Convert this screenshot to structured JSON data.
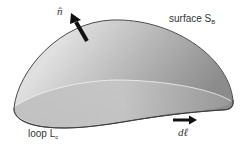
{
  "diagram": {
    "type": "surface bounded by a closed loop",
    "labels": {
      "normal": "n̂",
      "surface": "surface S",
      "surface_sub": "B",
      "loop": "loop L",
      "loop_sub": "c",
      "line_element": "dℓ⃗"
    },
    "colors": {
      "surface_fill_light": "#d8d8d8",
      "surface_fill_dark": "#8a8a8a",
      "outline": "#3a3a3a",
      "arrow": "#111111",
      "text": "#333333"
    }
  }
}
